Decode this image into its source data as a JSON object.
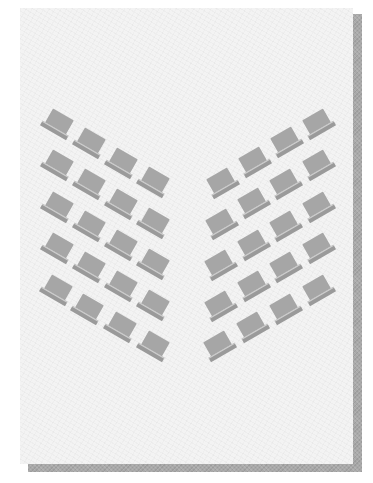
{
  "diagram": {
    "page_colors": {
      "paper": "#f3f3f3",
      "shadow": "#a9a9a9",
      "laptop_screen": "#a6a6a6",
      "laptop_base": "#9a9a9a"
    },
    "groups": [
      {
        "name": "left-group",
        "rows": 5,
        "columns": 4,
        "rotation_deg": 30,
        "positions": [
          [
            [
              58,
              124
            ],
            [
              90,
              143
            ],
            [
              122,
              163
            ],
            [
              154,
              182
            ]
          ],
          [
            [
              58,
              165
            ],
            [
              90,
              184
            ],
            [
              122,
              204
            ],
            [
              154,
              223
            ]
          ],
          [
            [
              58,
              207
            ],
            [
              90,
              226
            ],
            [
              122,
              245
            ],
            [
              154,
              264
            ]
          ],
          [
            [
              58,
              248
            ],
            [
              90,
              267
            ],
            [
              122,
              286
            ],
            [
              154,
              305
            ]
          ],
          [
            [
              57,
              290
            ],
            [
              88,
              309
            ],
            [
              121,
              327
            ],
            [
              154,
              346
            ]
          ]
        ]
      },
      {
        "name": "right-group",
        "rows": 5,
        "columns": 4,
        "rotation_deg": -30,
        "positions": [
          [
            [
              222,
              183
            ],
            [
              254,
              162
            ],
            [
              286,
              142
            ],
            [
              318,
              124
            ]
          ],
          [
            [
              221,
              224
            ],
            [
              253,
              203
            ],
            [
              285,
              184
            ],
            [
              318,
              165
            ]
          ],
          [
            [
              220,
              265
            ],
            [
              253,
              245
            ],
            [
              285,
              226
            ],
            [
              318,
              207
            ]
          ],
          [
            [
              220,
              306
            ],
            [
              253,
              286
            ],
            [
              285,
              267
            ],
            [
              318,
              248
            ]
          ],
          [
            [
              219,
              346
            ],
            [
              252,
              327
            ],
            [
              285,
              309
            ],
            [
              318,
              290
            ]
          ]
        ]
      }
    ],
    "laptop_count": 40,
    "icon": "laptop-icon"
  }
}
